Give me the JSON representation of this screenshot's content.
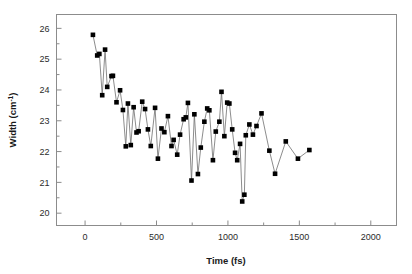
{
  "chart_data": {
    "type": "scatter",
    "title": "",
    "xlabel": "Time (fs)",
    "ylabel": "Width (cm⁻¹)",
    "ylabel_base": "Width (cm",
    "ylabel_exponent": "-1",
    "ylabel_close": ")",
    "xlim": [
      -200,
      2180
    ],
    "ylim": [
      19.6,
      26.45
    ],
    "xticks": [
      0,
      500,
      1000,
      1500,
      2000
    ],
    "xtick_labels": [
      "0",
      "500",
      "1000",
      "1500",
      "2000"
    ],
    "yticks": [
      20,
      21,
      22,
      23,
      24,
      25,
      26
    ],
    "ytick_labels": [
      "20",
      "21",
      "22",
      "23",
      "24",
      "25",
      "26"
    ],
    "x_minor_ticks": [
      250,
      750,
      1250,
      1750
    ],
    "y_minor_ticks": [
      20.5,
      21.5,
      22.5,
      23.5,
      24.5,
      25.5
    ],
    "grid": false,
    "legend": null,
    "marker": "square",
    "marker_color": "#000000",
    "marker_size": 4.6,
    "line_color": "#6e6e6e",
    "line_width": 0.8,
    "frame_color": "#8c8c8c",
    "background": "#ffffff",
    "series": [
      {
        "name": "Width vs delay time",
        "points": [
          [
            55,
            25.79
          ],
          [
            85,
            25.12
          ],
          [
            100,
            25.17
          ],
          [
            120,
            23.83
          ],
          [
            140,
            25.31
          ],
          [
            155,
            24.1
          ],
          [
            185,
            24.45
          ],
          [
            195,
            24.46
          ],
          [
            220,
            23.6
          ],
          [
            245,
            23.99
          ],
          [
            265,
            23.35
          ],
          [
            285,
            22.17
          ],
          [
            300,
            23.56
          ],
          [
            320,
            22.21
          ],
          [
            340,
            23.44
          ],
          [
            360,
            22.62
          ],
          [
            375,
            22.66
          ],
          [
            400,
            23.62
          ],
          [
            420,
            23.38
          ],
          [
            440,
            22.72
          ],
          [
            460,
            22.18
          ],
          [
            490,
            23.42
          ],
          [
            510,
            21.77
          ],
          [
            535,
            22.75
          ],
          [
            555,
            22.63
          ],
          [
            580,
            23.15
          ],
          [
            605,
            22.18
          ],
          [
            620,
            22.38
          ],
          [
            645,
            21.9
          ],
          [
            665,
            22.55
          ],
          [
            690,
            23.05
          ],
          [
            705,
            23.11
          ],
          [
            720,
            23.58
          ],
          [
            745,
            21.06
          ],
          [
            765,
            23.21
          ],
          [
            790,
            21.27
          ],
          [
            810,
            22.13
          ],
          [
            835,
            22.97
          ],
          [
            855,
            23.4
          ],
          [
            870,
            23.34
          ],
          [
            895,
            21.72
          ],
          [
            915,
            22.65
          ],
          [
            940,
            22.97
          ],
          [
            955,
            23.94
          ],
          [
            975,
            22.5
          ],
          [
            995,
            23.59
          ],
          [
            1010,
            23.56
          ],
          [
            1030,
            22.72
          ],
          [
            1050,
            21.96
          ],
          [
            1065,
            21.72
          ],
          [
            1085,
            22.25
          ],
          [
            1100,
            20.38
          ],
          [
            1115,
            20.6
          ],
          [
            1125,
            22.53
          ],
          [
            1150,
            22.88
          ],
          [
            1175,
            22.55
          ],
          [
            1200,
            22.83
          ],
          [
            1235,
            23.24
          ],
          [
            1290,
            22.03
          ],
          [
            1330,
            21.28
          ],
          [
            1405,
            22.33
          ],
          [
            1490,
            21.77
          ],
          [
            1570,
            22.05
          ]
        ]
      }
    ]
  },
  "axes": {
    "x_axis_name": "time-axis",
    "y_axis_name": "width-axis"
  }
}
